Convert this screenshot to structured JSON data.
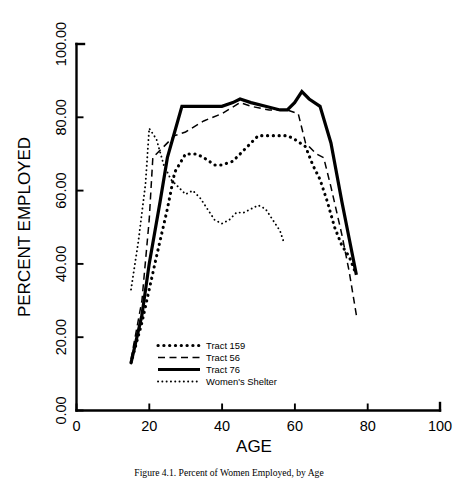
{
  "figure": {
    "caption": "Figure 4.1. Percent of Women Employed, by Age"
  },
  "chart_data": {
    "type": "line",
    "title": "",
    "xlabel": "AGE",
    "ylabel": "PERCENT EMPLOYED",
    "xlim": [
      0,
      100
    ],
    "ylim": [
      0,
      100
    ],
    "xticks": [
      0,
      20,
      40,
      60,
      80,
      100
    ],
    "xtick_labels": [
      "0",
      "20",
      "40",
      "60",
      "80",
      "100"
    ],
    "yticks": [
      0,
      20,
      40,
      60,
      80,
      100
    ],
    "ytick_labels": [
      "0.00",
      "20.00",
      "40.00",
      "60.00",
      "80.00",
      "100.00"
    ],
    "grid": false,
    "legend_position": "lower-center-left",
    "series": [
      {
        "name": "Tract 159",
        "style": "thick-dotted",
        "color": "#000000",
        "x": [
          15,
          18,
          20,
          22,
          25,
          27,
          30,
          33,
          35,
          38,
          40,
          43,
          45,
          48,
          50,
          53,
          55,
          58,
          60,
          63,
          65,
          67,
          69,
          71,
          73,
          75,
          77
        ],
        "y": [
          13,
          24,
          33,
          42,
          55,
          65,
          70,
          70,
          69,
          67,
          67,
          68,
          70,
          73,
          75,
          75,
          75,
          75,
          74,
          72,
          67,
          63,
          57,
          50,
          45,
          42,
          37
        ]
      },
      {
        "name": "Tract 56",
        "style": "dashed",
        "color": "#000000",
        "x": [
          15,
          18,
          20,
          21,
          24,
          27,
          30,
          35,
          40,
          45,
          48,
          53,
          58,
          61,
          63,
          66,
          68,
          70,
          73,
          75,
          77
        ],
        "y": [
          14,
          30,
          52,
          69,
          72,
          75,
          76,
          79,
          81,
          84,
          83,
          82,
          82,
          81,
          73,
          70,
          69,
          61,
          48,
          38,
          26
        ]
      },
      {
        "name": "Tract 76",
        "style": "solid",
        "color": "#000000",
        "x": [
          15,
          18,
          20,
          23,
          25,
          27,
          29,
          32,
          36,
          40,
          43,
          45,
          48,
          52,
          56,
          58,
          60,
          62,
          64,
          67,
          70,
          73,
          75,
          77
        ],
        "y": [
          13,
          26,
          40,
          57,
          69,
          76,
          83,
          83,
          83,
          83,
          84,
          85,
          84,
          83,
          82,
          82,
          84,
          87,
          85,
          83,
          73,
          57,
          47,
          37
        ]
      },
      {
        "name": "Women's Shelter",
        "style": "fine-dotted",
        "color": "#000000",
        "x": [
          15,
          17,
          19,
          20,
          22,
          24,
          26,
          28,
          30,
          32,
          34,
          36,
          38,
          40,
          42,
          44,
          46,
          48,
          50,
          52,
          54,
          56,
          57
        ],
        "y": [
          33,
          46,
          62,
          77,
          74,
          67,
          63,
          61,
          59,
          60,
          58,
          55,
          52,
          51,
          52,
          54,
          54,
          55,
          56,
          55,
          52,
          49,
          46
        ]
      }
    ]
  },
  "legend": {
    "entries": [
      {
        "label": "Tract 159",
        "style": "thick-dotted"
      },
      {
        "label": "Tract 56",
        "style": "dashed"
      },
      {
        "label": "Tract 76",
        "style": "solid"
      },
      {
        "label": "Women's Shelter",
        "style": "fine-dotted"
      }
    ]
  }
}
